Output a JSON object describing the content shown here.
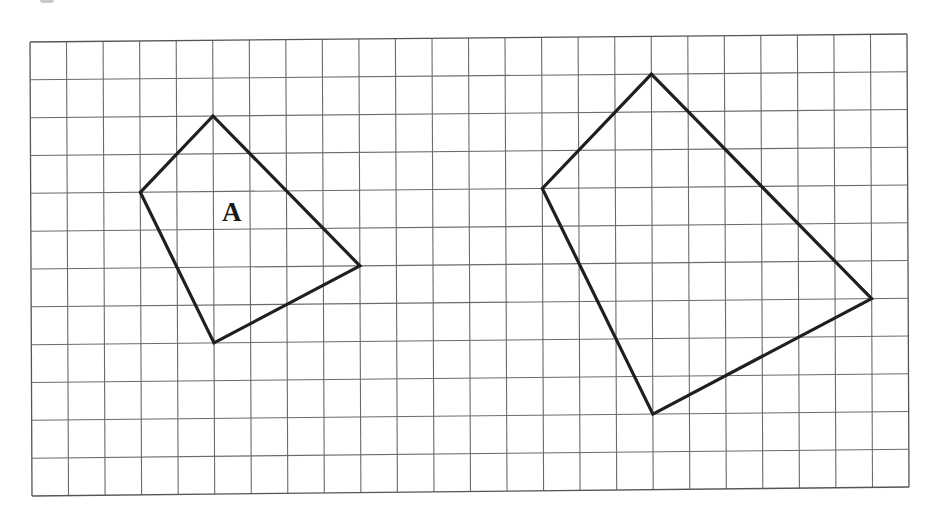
{
  "diagram": {
    "type": "grid-enlargement",
    "grid": {
      "columns": 24,
      "rows": 12,
      "corners_px": {
        "top_left": [
          30,
          42
        ],
        "top_right": [
          907,
          34
        ],
        "bottom_left": [
          32,
          496
        ],
        "bottom_right": [
          909,
          487
        ]
      },
      "line_color": "#6b6b6b"
    },
    "shapes": [
      {
        "id": "A",
        "label": "A",
        "vertices_grid": [
          [
            5,
            2
          ],
          [
            9,
            6
          ],
          [
            5,
            8
          ],
          [
            3,
            4
          ]
        ],
        "label_grid": [
          5.5,
          4.55
        ],
        "stroke_color": "#1f1f1f"
      },
      {
        "id": "B",
        "label": "",
        "vertices_grid": [
          [
            17,
            1
          ],
          [
            23,
            7
          ],
          [
            17,
            10
          ],
          [
            14,
            4
          ]
        ],
        "stroke_color": "#1f1f1f"
      }
    ],
    "scale_factor": "1.5"
  }
}
